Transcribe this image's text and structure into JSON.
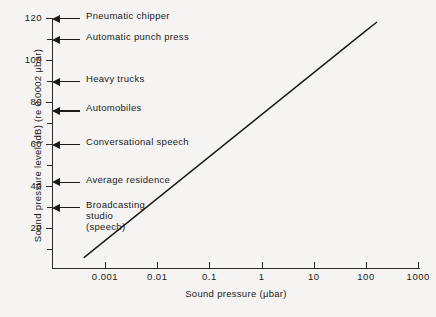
{
  "chart_data": {
    "type": "line",
    "title": "",
    "xlabel": "Sound pressure (μbar)",
    "ylabel": "Sound pressure level (dB) (re 0.0002 μbar)",
    "x_scale": "log",
    "y_scale": "linear",
    "xlim": [
      0.0002,
      2000
    ],
    "ylim": [
      0,
      125
    ],
    "grid": false,
    "legend": null,
    "x_ticks": [
      {
        "value": 0.001,
        "label": "0.001"
      },
      {
        "value": 0.01,
        "label": "0.01"
      },
      {
        "value": 0.1,
        "label": "0.1"
      },
      {
        "value": 1,
        "label": "1"
      },
      {
        "value": 10,
        "label": "10"
      },
      {
        "value": 100,
        "label": "100"
      },
      {
        "value": 1000,
        "label": "1000"
      }
    ],
    "y_ticks_major": [
      {
        "value": 20,
        "label": "20"
      },
      {
        "value": 40,
        "label": "40"
      },
      {
        "value": 60,
        "label": "60"
      },
      {
        "value": 80,
        "label": "80"
      },
      {
        "value": 100,
        "label": "100"
      },
      {
        "value": 120,
        "label": "120"
      }
    ],
    "y_ticks_minor": [
      10,
      30,
      50,
      70,
      90,
      110
    ],
    "series": [
      {
        "name": "Sound pressure level vs sound pressure",
        "relation": "dB = 20 log10(p / 0.0002 μbar)",
        "points": [
          {
            "x": 0.0004,
            "y": 6
          },
          {
            "x": 0.001,
            "y": 14
          },
          {
            "x": 0.01,
            "y": 34
          },
          {
            "x": 0.1,
            "y": 54
          },
          {
            "x": 1,
            "y": 74
          },
          {
            "x": 10,
            "y": 94
          },
          {
            "x": 100,
            "y": 114
          },
          {
            "x": 160,
            "y": 118
          }
        ]
      }
    ],
    "annotations": [
      {
        "label": "Pneumatic chipper",
        "db": 120
      },
      {
        "label": "Automatic punch press",
        "db": 110
      },
      {
        "label": "Heavy trucks",
        "db": 90
      },
      {
        "label": "Automobiles",
        "db": 76
      },
      {
        "label": "Conversational speech",
        "db": 60
      },
      {
        "label": "Average residence",
        "db": 42
      },
      {
        "label": "Broadcasting\nstudio\n(speech)",
        "db": 30
      }
    ]
  },
  "colors": {
    "background": "#f5f4f2",
    "ink": "#1a1a1a",
    "axis": "#2b2b2b"
  }
}
